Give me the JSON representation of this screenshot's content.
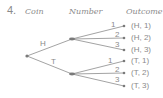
{
  "problem": {
    "number": "4."
  },
  "headers": {
    "coin": "Coin",
    "number": "Number",
    "outcome": "Outcome"
  },
  "tree": {
    "root": "root",
    "coin_branches": [
      {
        "label": "H",
        "number_branches": [
          "1",
          "2",
          "3"
        ]
      },
      {
        "label": "T",
        "number_branches": [
          "1",
          "2",
          "3"
        ]
      }
    ]
  },
  "outcomes": [
    "(H, 1)",
    "(H, 2)",
    "(H, 3)",
    "(T, 1)",
    "(T, 2)",
    "(T, 3)"
  ],
  "colors": {
    "line": "#8c8c8c",
    "text": "#8a8a8a",
    "node": "#7a7a7a"
  }
}
